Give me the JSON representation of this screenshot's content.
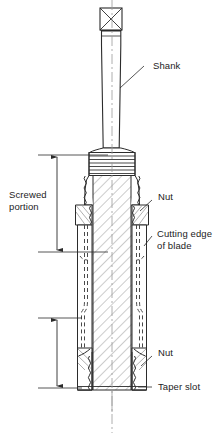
{
  "figure": {
    "background_color": "#ffffff",
    "line_color": "#2b2b2b",
    "hatch_color": "#8a8a8a",
    "text_color": "#1c1c1c"
  },
  "labels": {
    "shank": "Shank",
    "screwed_portion": "Screwed\nportion",
    "nut_upper": "Nut",
    "cutting_edge": "Cutting edge\nof blade",
    "nut_lower": "Nut",
    "taper_slot": "Taper slot"
  },
  "parts": [
    {
      "name": "square-head",
      "label": "Square head",
      "shown_label": false
    },
    {
      "name": "shank",
      "label": "Shank",
      "shown_label": true
    },
    {
      "name": "screwed-portion",
      "label": "Screwed portion",
      "shown_label": true
    },
    {
      "name": "nut-upper",
      "label": "Nut",
      "shown_label": true
    },
    {
      "name": "cutting-edge-of-blade",
      "label": "Cutting edge of blade",
      "shown_label": true
    },
    {
      "name": "nut-lower",
      "label": "Nut",
      "shown_label": true
    },
    {
      "name": "taper-slot",
      "label": "Taper slot",
      "shown_label": true
    }
  ],
  "dimensions": [
    {
      "name": "screwed-portion-dimension",
      "from_y": 155,
      "to_y": 252,
      "has_arrows": true
    },
    {
      "name": "lower-dimension",
      "from_y": 318,
      "to_y": 388,
      "has_arrows": true
    }
  ]
}
